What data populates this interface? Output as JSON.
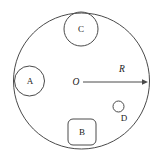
{
  "figure": {
    "type": "geometric-diagram",
    "background_color": "#ffffff",
    "stroke_color": "#4a4a4a",
    "text_color": "#1a1a1a",
    "canvas": {
      "width": 163,
      "height": 163
    },
    "main_circle": {
      "name": "main-circle",
      "center_x": 81.5,
      "center_y": 81,
      "radius": 68
    },
    "radius_indicator": {
      "name": "radius-arrow",
      "label": "R",
      "origin_label": "O",
      "start_x": 83,
      "start_y": 82,
      "end_x": 148,
      "end_y": 82,
      "label_x": 122,
      "label_y": 70,
      "origin_x": 76,
      "origin_y": 83
    },
    "objects": [
      {
        "name": "object-a",
        "label": "A",
        "shape": "circle",
        "center_x": 29.5,
        "center_y": 81,
        "radius": 15,
        "label_x": 30,
        "label_y": 81.5
      },
      {
        "name": "object-c",
        "label": "C",
        "shape": "circle",
        "center_x": 81,
        "center_y": 29,
        "radius": 17,
        "label_x": 81,
        "label_y": 30
      },
      {
        "name": "object-b",
        "label": "B",
        "shape": "rounded-rect",
        "x": 68,
        "y": 119,
        "width": 28,
        "height": 26,
        "corner_radius": 5,
        "label_x": 82,
        "label_y": 132.5
      },
      {
        "name": "object-d",
        "label": "D",
        "shape": "circle",
        "center_x": 118.5,
        "center_y": 106.5,
        "radius": 5.5,
        "label_x": 124,
        "label_y": 119
      }
    ]
  }
}
